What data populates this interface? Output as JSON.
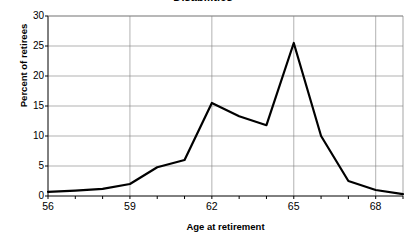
{
  "chart_data": {
    "type": "line",
    "title": "Disabilities",
    "title_clipped": true,
    "xlabel": "Age at retirement",
    "ylabel": "Percent of retirees",
    "xlim": [
      56,
      69
    ],
    "ylim": [
      0,
      30
    ],
    "y_ticks": [
      0,
      5,
      10,
      15,
      20,
      25,
      30
    ],
    "y_tick_labels": [
      "0",
      "5",
      "10",
      "15",
      "20",
      "25",
      "30"
    ],
    "x_ticks": [
      56,
      57,
      58,
      59,
      60,
      61,
      62,
      63,
      64,
      65,
      66,
      67,
      68,
      69
    ],
    "x_tick_labels_shown": [
      "56",
      "59",
      "62",
      "65",
      "68"
    ],
    "x_tick_label_values": [
      56,
      59,
      62,
      65,
      68
    ],
    "grid": {
      "horizontal": true,
      "vertical": true,
      "vertical_at": [
        59,
        62,
        65,
        68
      ],
      "color": "#808080"
    },
    "legend": null,
    "line_color": "#000000",
    "line_width": 2.2,
    "x": [
      56,
      57,
      58,
      59,
      60,
      61,
      62,
      63,
      64,
      65,
      66,
      67,
      68,
      69
    ],
    "values": [
      0.7,
      0.9,
      1.2,
      2.0,
      4.8,
      6.0,
      15.5,
      13.3,
      11.8,
      25.5,
      10.0,
      2.5,
      1.0,
      0.3
    ],
    "series": [
      {
        "name": "Disabilities",
        "x": [
          56,
          57,
          58,
          59,
          60,
          61,
          62,
          63,
          64,
          65,
          66,
          67,
          68,
          69
        ],
        "values": [
          0.7,
          0.9,
          1.2,
          2.0,
          4.8,
          6.0,
          15.5,
          13.3,
          11.8,
          25.5,
          10.0,
          2.5,
          1.0,
          0.3
        ]
      }
    ]
  },
  "axes": {
    "y_ticks": [
      "0",
      "5",
      "10",
      "15",
      "20",
      "25",
      "30"
    ],
    "x_ticks": [
      "56",
      "59",
      "62",
      "65",
      "68"
    ],
    "y_title": "Percent of retirees",
    "x_title": "Age at retirement"
  },
  "title": "Disabilities"
}
